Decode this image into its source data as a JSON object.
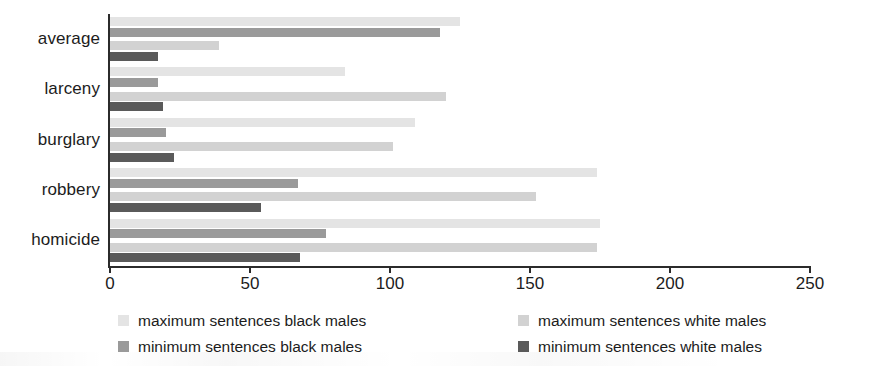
{
  "chart_data": {
    "type": "bar",
    "orientation": "horizontal",
    "title": "",
    "xlabel": "",
    "ylabel": "",
    "xlim": [
      0,
      250
    ],
    "xticks": [
      0,
      50,
      100,
      150,
      200,
      250
    ],
    "xtick_labels": [
      "0",
      "50",
      "100",
      "150",
      "200",
      "250"
    ],
    "grid": false,
    "legend_position": "bottom",
    "categories": [
      "average",
      "larceny",
      "burglary",
      "robbery",
      "homicide"
    ],
    "series": [
      {
        "name": "maximum sentences black males",
        "color": "#e4e4e4",
        "values": [
          125,
          84,
          109,
          174,
          175
        ]
      },
      {
        "name": "minimum sentences black males",
        "color": "#9a9a9a",
        "values": [
          118,
          17,
          20,
          67,
          77
        ]
      },
      {
        "name": "maximum sentences white males",
        "color": "#d2d2d2",
        "values": [
          39,
          120,
          101,
          152,
          174
        ]
      },
      {
        "name": "minimum sentences white males",
        "color": "#5a5a5a",
        "values": [
          17,
          19,
          23,
          54,
          68
        ]
      }
    ]
  },
  "axis": {
    "tick_labels": [
      "0",
      "50",
      "100",
      "150",
      "200",
      "250"
    ]
  },
  "category_labels": [
    "average",
    "larceny",
    "burglary",
    "robbery",
    "homicide"
  ],
  "legend": {
    "items": [
      {
        "label": "maximum sentences black males",
        "color": "#e4e4e4"
      },
      {
        "label": "minimum sentences black males",
        "color": "#9a9a9a"
      },
      {
        "label": "maximum sentences white males",
        "color": "#d2d2d2"
      },
      {
        "label": "minimum sentences white males",
        "color": "#5a5a5a"
      }
    ]
  }
}
